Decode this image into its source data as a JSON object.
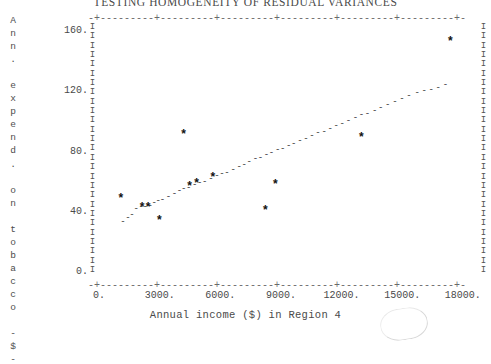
{
  "title": "TESTING HOMOGENEITY OF RESIDUAL VARIANCES",
  "ylabel_chars": [
    "A",
    "n",
    "n",
    ".",
    "",
    "e",
    "x",
    "p",
    "e",
    "n",
    "d",
    ".",
    "",
    "o",
    "n",
    "",
    "t",
    "o",
    "b",
    "a",
    "c",
    "c",
    "o",
    "",
    "-",
    "$",
    "-"
  ],
  "xlabel": "Annual income ($) in Region 4",
  "yticks": [
    "160.",
    "120.",
    "80.",
    "40.",
    "0."
  ],
  "xticks": [
    "0.",
    "3000.",
    "6000.",
    "9000.",
    "12000.",
    "15000.",
    "18000."
  ],
  "rule_text": "-+---------+---------+---------+---------+---------+---------+-",
  "rail_char": "I",
  "marker_small": "-",
  "marker_big": "*",
  "chart_data": {
    "type": "scatter",
    "title": "TESTING HOMOGENEITY OF RESIDUAL VARIANCES",
    "xlabel": "Annual income ($) in Region 4",
    "ylabel": "Ann. expend. on tobacco -$-",
    "xlim": [
      0,
      18600
    ],
    "ylim": [
      0,
      168
    ],
    "xticks": [
      0,
      3000,
      6000,
      9000,
      12000,
      15000,
      18000
    ],
    "yticks": [
      0,
      40,
      80,
      120,
      160
    ],
    "grid": false,
    "legend": false,
    "series": [
      {
        "name": "observations",
        "marker": "dot",
        "points": [
          [
            1150,
            33
          ],
          [
            1400,
            36
          ],
          [
            1600,
            38
          ],
          [
            1800,
            42
          ],
          [
            2050,
            43
          ],
          [
            2250,
            43
          ],
          [
            2500,
            44
          ],
          [
            2700,
            46
          ],
          [
            2900,
            47
          ],
          [
            3100,
            48
          ],
          [
            3400,
            50
          ],
          [
            3700,
            52
          ],
          [
            3950,
            54
          ],
          [
            4150,
            55
          ],
          [
            4400,
            56
          ],
          [
            4700,
            58
          ],
          [
            4950,
            59
          ],
          [
            5200,
            60
          ],
          [
            5500,
            62
          ],
          [
            5800,
            64
          ],
          [
            6050,
            65
          ],
          [
            6300,
            66
          ],
          [
            6600,
            68
          ],
          [
            6900,
            70
          ],
          [
            7150,
            71
          ],
          [
            7400,
            73
          ],
          [
            7700,
            75
          ],
          [
            7950,
            76
          ],
          [
            8250,
            78
          ],
          [
            8500,
            79
          ],
          [
            8800,
            81
          ],
          [
            9050,
            82
          ],
          [
            9350,
            84
          ],
          [
            9600,
            85
          ],
          [
            9900,
            87
          ],
          [
            10200,
            88
          ],
          [
            10500,
            90
          ],
          [
            10800,
            92
          ],
          [
            11100,
            93
          ],
          [
            11400,
            95
          ],
          [
            11700,
            97
          ],
          [
            12000,
            98
          ],
          [
            12300,
            100
          ],
          [
            12650,
            102
          ],
          [
            12950,
            104
          ],
          [
            13250,
            105
          ],
          [
            13600,
            107
          ],
          [
            13900,
            109
          ],
          [
            14250,
            111
          ],
          [
            14600,
            113
          ],
          [
            14950,
            115
          ],
          [
            15300,
            117
          ],
          [
            15700,
            119
          ],
          [
            16050,
            120
          ],
          [
            16400,
            121
          ],
          [
            16750,
            122
          ],
          [
            17100,
            124
          ]
        ]
      },
      {
        "name": "flagged observations",
        "marker": "asterisk",
        "points": [
          [
            1050,
            48
          ],
          [
            2100,
            42
          ],
          [
            2400,
            42
          ],
          [
            2950,
            33
          ],
          [
            4450,
            56
          ],
          [
            4800,
            58
          ],
          [
            5600,
            62
          ],
          [
            4150,
            90
          ],
          [
            8200,
            40
          ],
          [
            8700,
            57
          ],
          [
            12950,
            88
          ],
          [
            17350,
            152
          ]
        ]
      }
    ]
  }
}
